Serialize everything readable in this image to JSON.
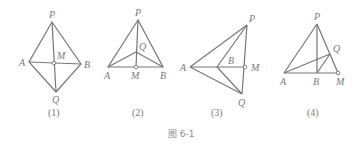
{
  "caption": "图 6-1",
  "figures": [
    {
      "sublabel": "(1)",
      "points": {
        "P": "P",
        "A": "A",
        "B": "B",
        "M": "M",
        "Q": "Q"
      }
    },
    {
      "sublabel": "(2)",
      "points": {
        "P": "P",
        "A": "A",
        "B": "B",
        "M": "M",
        "Q": "Q"
      }
    },
    {
      "sublabel": "(3)",
      "points": {
        "P": "P",
        "A": "A",
        "B": "B",
        "M": "M",
        "Q": "Q"
      }
    },
    {
      "sublabel": "(4)",
      "points": {
        "P": "P",
        "A": "A",
        "B": "B",
        "M": "M",
        "Q": "Q"
      }
    }
  ],
  "colors": {
    "line": "#777777",
    "text": "#7a7a7a"
  }
}
